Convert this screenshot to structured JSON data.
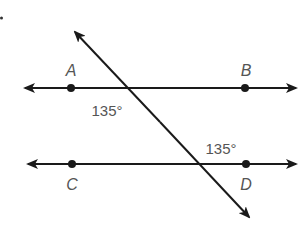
{
  "figure": {
    "type": "geometry-parallel-lines-transversal",
    "colors": {
      "line": "#1a1a1a",
      "label": "#555555",
      "background": "#ffffff"
    },
    "lines": {
      "AB": {
        "y": 88,
        "x1": 25,
        "x2": 296
      },
      "CD": {
        "y": 164,
        "x1": 28,
        "x2": 296
      },
      "transversal": {
        "x1": 75,
        "y1": 32,
        "x2": 249,
        "y2": 217
      }
    },
    "points": [
      {
        "name": "A",
        "label": "A",
        "x": 71,
        "y": 88,
        "label_x": 71,
        "label_y": 76
      },
      {
        "name": "B",
        "label": "B",
        "x": 245,
        "y": 88,
        "label_x": 246,
        "label_y": 76
      },
      {
        "name": "C",
        "label": "C",
        "x": 72,
        "y": 164,
        "label_x": 72,
        "label_y": 190
      },
      {
        "name": "D",
        "label": "D",
        "x": 246,
        "y": 164,
        "label_x": 246,
        "label_y": 190
      }
    ],
    "angles": [
      {
        "name": "angle-at-AB",
        "label": "135°",
        "x": 107,
        "y": 116
      },
      {
        "name": "angle-at-CD",
        "label": "135°",
        "x": 221,
        "y": 154
      }
    ],
    "corner_mark": {
      "x": 1.5,
      "y": 18
    }
  }
}
